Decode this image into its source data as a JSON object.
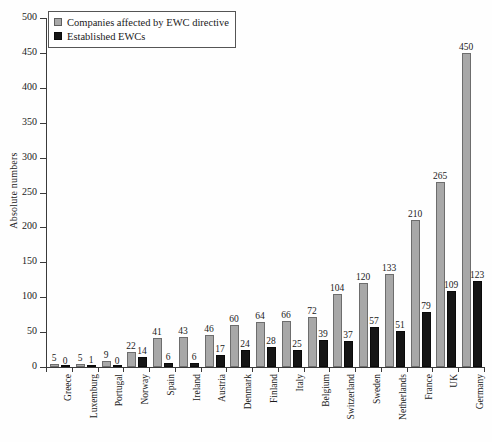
{
  "chart_data": {
    "type": "bar",
    "title": "",
    "xlabel": "",
    "ylabel": "Absolute numbers",
    "ylim": [
      0,
      500
    ],
    "yticks": [
      0,
      50,
      100,
      150,
      200,
      250,
      300,
      350,
      400,
      450,
      500
    ],
    "grid": false,
    "legend_position": "top-left",
    "categories": [
      "Greece",
      "Luxemburg",
      "Portugal",
      "Norway",
      "Spain",
      "Ireland",
      "Austria",
      "Denmark",
      "Finland",
      "Italy",
      "Belgium",
      "Switzerland",
      "Sweden",
      "Netherlands",
      "France",
      "UK",
      "Germany"
    ],
    "series": [
      {
        "name": "Companies affected by EWC directive",
        "color": "#a8a8a8",
        "values": [
          5,
          5,
          9,
          22,
          41,
          43,
          46,
          60,
          64,
          66,
          72,
          104,
          120,
          133,
          210,
          265,
          450
        ]
      },
      {
        "name": "Established EWCs",
        "color": "#151515",
        "values": [
          0,
          1,
          0,
          14,
          6,
          6,
          17,
          24,
          28,
          25,
          39,
          37,
          57,
          51,
          79,
          109,
          123
        ]
      }
    ]
  },
  "legend": {
    "items": [
      {
        "label": "Companies affected by EWC directive",
        "swatch": "gray"
      },
      {
        "label": "Established EWCs",
        "swatch": "black"
      }
    ]
  },
  "axes": {
    "y_title": "Absolute numbers"
  }
}
